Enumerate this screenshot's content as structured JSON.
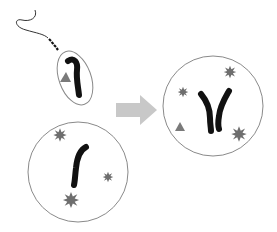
{
  "diagram": {
    "type": "fertilization",
    "colors": {
      "outline": "#8a8a8a",
      "chromosome": "#111111",
      "granule": "#6e6e6e",
      "triangle": "#7a7a7a",
      "arrow": "#c8c8c8",
      "tail": "#333333"
    },
    "sperm": {
      "label": "",
      "chromosomes": 1,
      "triangle": 1
    },
    "egg": {
      "label": "",
      "chromosomes": 1,
      "granules": 3
    },
    "arrow": {
      "direction": "right"
    },
    "zygote": {
      "label": "",
      "chromosomes": 2,
      "granules": 3,
      "triangle": 1
    }
  }
}
